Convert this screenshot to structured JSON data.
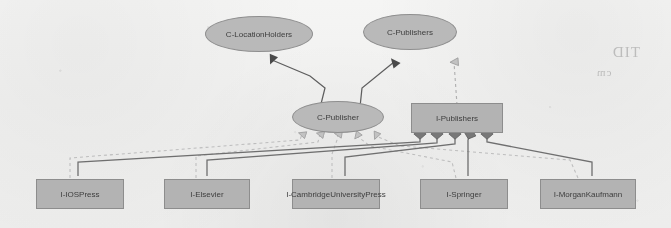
{
  "diagram": {
    "type": "uml-class-diagram",
    "palette": {
      "page_background": "#f1f0ee",
      "node_fill_ellipse": "#b9b9b9",
      "node_fill_rect": "#b3b3b3",
      "node_border": "#8e8e8e",
      "solid_edge": "#6d6d6d",
      "dashed_edge": "#9a9a9a",
      "text": "#3d3d3d"
    },
    "classes": [
      {
        "id": "c-locationholders",
        "label": "C-LocationHolders",
        "shape": "ellipse"
      },
      {
        "id": "c-publishers",
        "label": "C-Publishers",
        "shape": "ellipse"
      },
      {
        "id": "c-publisher",
        "label": "C-Publisher",
        "shape": "ellipse"
      }
    ],
    "collections": [
      {
        "id": "i-publishers",
        "label": "I-Publishers",
        "shape": "rectangle"
      }
    ],
    "instances": [
      {
        "id": "i-iospress",
        "label": "I-IOSPress",
        "shape": "rectangle"
      },
      {
        "id": "i-elsevier",
        "label": "I-Elsevier",
        "shape": "rectangle"
      },
      {
        "id": "i-cambridgeuniversitypress",
        "label": "I-CambridgeUniversityPress",
        "shape": "rectangle"
      },
      {
        "id": "i-springer",
        "label": "I-Springer",
        "shape": "rectangle"
      },
      {
        "id": "i-morgankaufmann",
        "label": "I-MorganKaufmann",
        "shape": "rectangle"
      }
    ],
    "edges": [
      {
        "from": "c-publisher",
        "to": "c-locationholders",
        "style": "solid",
        "head": "filled-triangle",
        "kind": "generalization"
      },
      {
        "from": "c-publisher",
        "to": "c-publishers",
        "style": "solid",
        "head": "filled-triangle",
        "kind": "generalization"
      },
      {
        "from": "i-publishers",
        "to": "c-publishers",
        "style": "dashed",
        "head": "open-triangle",
        "kind": "instance-of"
      },
      {
        "from": "i-iospress",
        "to": "c-publisher",
        "style": "dashed",
        "head": "open-triangle",
        "kind": "instance-of"
      },
      {
        "from": "i-elsevier",
        "to": "c-publisher",
        "style": "dashed",
        "head": "open-triangle",
        "kind": "instance-of"
      },
      {
        "from": "i-cambridgeuniversitypress",
        "to": "c-publisher",
        "style": "dashed",
        "head": "open-triangle",
        "kind": "instance-of"
      },
      {
        "from": "i-springer",
        "to": "c-publisher",
        "style": "dashed",
        "head": "open-triangle",
        "kind": "instance-of"
      },
      {
        "from": "i-morgankaufmann",
        "to": "c-publisher",
        "style": "dashed",
        "head": "open-triangle",
        "kind": "instance-of"
      },
      {
        "from": "i-iospress",
        "to": "i-publishers",
        "style": "solid",
        "head": "diamond",
        "kind": "membership"
      },
      {
        "from": "i-elsevier",
        "to": "i-publishers",
        "style": "solid",
        "head": "diamond",
        "kind": "membership"
      },
      {
        "from": "i-cambridgeuniversitypress",
        "to": "i-publishers",
        "style": "solid",
        "head": "diamond",
        "kind": "membership"
      },
      {
        "from": "i-springer",
        "to": "i-publishers",
        "style": "solid",
        "head": "diamond",
        "kind": "membership"
      },
      {
        "from": "i-morgankaufmann",
        "to": "i-publishers",
        "style": "solid",
        "head": "diamond",
        "kind": "membership"
      }
    ]
  },
  "page_artifacts": {
    "bleed_through_1": "TID",
    "bleed_through_2": "cm"
  }
}
